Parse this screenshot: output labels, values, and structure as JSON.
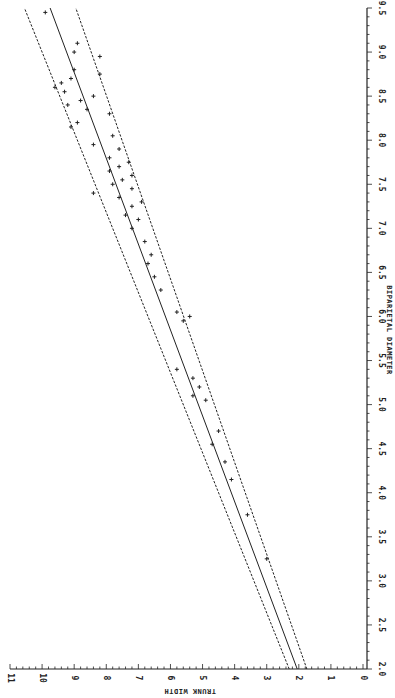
{
  "chart_data": {
    "type": "scatter",
    "title": "",
    "orientation": "rotated-90-ccw",
    "xlabel": "BIPARIETAL DIAMETER",
    "ylabel": "TRUNK WIDTH",
    "xlim": [
      2.0,
      9.5
    ],
    "ylim": [
      0,
      11
    ],
    "x_ticks": [
      "2.0",
      "2.5",
      "3.0",
      "3.5",
      "4.0",
      "4.5",
      "5.0",
      "5.5",
      "6.0",
      "6.5",
      "7.0",
      "7.5",
      "8.0",
      "8.5",
      "9.0",
      "9.5"
    ],
    "y_ticks": [
      "0",
      "1",
      "2",
      "3",
      "4",
      "5",
      "6",
      "7",
      "8",
      "9",
      "10",
      "11"
    ],
    "grid": false,
    "legend": null,
    "series": [
      {
        "name": "observations",
        "marker": "+",
        "points": [
          [
            9.45,
            9.9
          ],
          [
            9.1,
            8.9
          ],
          [
            9.0,
            9.0
          ],
          [
            8.95,
            8.2
          ],
          [
            8.8,
            9.0
          ],
          [
            8.75,
            8.2
          ],
          [
            8.7,
            9.1
          ],
          [
            8.65,
            9.4
          ],
          [
            8.6,
            9.6
          ],
          [
            8.55,
            9.3
          ],
          [
            8.5,
            8.4
          ],
          [
            8.45,
            8.8
          ],
          [
            8.4,
            9.2
          ],
          [
            8.35,
            8.6
          ],
          [
            8.3,
            7.9
          ],
          [
            8.2,
            8.9
          ],
          [
            8.15,
            9.1
          ],
          [
            8.05,
            7.8
          ],
          [
            7.95,
            8.4
          ],
          [
            7.9,
            7.6
          ],
          [
            7.8,
            7.9
          ],
          [
            7.75,
            7.3
          ],
          [
            7.7,
            7.6
          ],
          [
            7.65,
            7.9
          ],
          [
            7.6,
            7.2
          ],
          [
            7.55,
            7.5
          ],
          [
            7.5,
            7.8
          ],
          [
            7.45,
            7.2
          ],
          [
            7.4,
            8.4
          ],
          [
            7.35,
            7.6
          ],
          [
            7.3,
            6.9
          ],
          [
            7.25,
            7.2
          ],
          [
            7.15,
            7.4
          ],
          [
            7.1,
            7.0
          ],
          [
            7.0,
            7.2
          ],
          [
            6.85,
            6.8
          ],
          [
            6.7,
            6.6
          ],
          [
            6.6,
            6.7
          ],
          [
            6.45,
            6.5
          ],
          [
            6.3,
            6.3
          ],
          [
            6.05,
            5.8
          ],
          [
            6.0,
            5.4
          ],
          [
            5.95,
            5.6
          ],
          [
            5.4,
            5.8
          ],
          [
            5.3,
            5.3
          ],
          [
            5.2,
            5.1
          ],
          [
            5.1,
            5.3
          ],
          [
            5.05,
            4.9
          ],
          [
            4.7,
            4.5
          ],
          [
            4.55,
            4.7
          ],
          [
            4.35,
            4.3
          ],
          [
            4.15,
            4.1
          ],
          [
            3.75,
            3.6
          ],
          [
            3.25,
            3.0
          ]
        ]
      }
    ],
    "lines": [
      {
        "name": "regression",
        "style": "solid",
        "from": [
          2.0,
          2.05
        ],
        "to": [
          9.5,
          9.75
        ]
      },
      {
        "name": "upper-limit",
        "style": "dashed",
        "from": [
          2.0,
          2.3
        ],
        "to": [
          9.5,
          10.55
        ]
      },
      {
        "name": "lower-limit",
        "style": "dashed",
        "from": [
          2.0,
          1.75
        ],
        "to": [
          9.5,
          8.95
        ]
      }
    ]
  }
}
